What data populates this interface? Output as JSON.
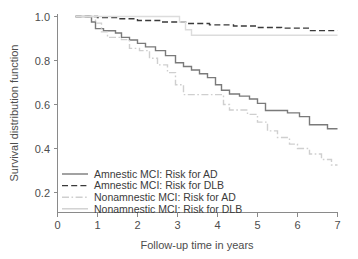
{
  "chart_data": {
    "type": "line",
    "title": "",
    "xlabel": "Follow-up time in years",
    "ylabel": "Survival distribution function",
    "xlim": [
      0,
      7
    ],
    "ylim": [
      0.13,
      1.02
    ],
    "xticks": [
      0,
      1,
      2,
      3,
      4,
      5,
      6,
      7
    ],
    "xtick_labels": [
      "0",
      "1",
      "2",
      "3",
      "4",
      "5",
      "6",
      "7"
    ],
    "yticks": [
      0.2,
      0.4,
      0.6,
      0.8,
      1.0
    ],
    "ytick_labels": [
      "0.2",
      "0.4",
      "0.6",
      "0.8",
      "1.0"
    ],
    "grid": false,
    "legend_position": "lower-left",
    "series": [
      {
        "name": "Amnestic MCI: Risk for AD",
        "style": "solid",
        "color": "#7a7a7a",
        "width": 1.4,
        "points": [
          [
            0.45,
            1.0
          ],
          [
            0.85,
            1.0
          ],
          [
            0.85,
            0.975
          ],
          [
            0.95,
            0.975
          ],
          [
            0.95,
            0.945
          ],
          [
            1.15,
            0.945
          ],
          [
            1.15,
            0.935
          ],
          [
            1.45,
            0.935
          ],
          [
            1.45,
            0.925
          ],
          [
            1.6,
            0.925
          ],
          [
            1.6,
            0.905
          ],
          [
            1.8,
            0.905
          ],
          [
            1.8,
            0.893
          ],
          [
            2.0,
            0.893
          ],
          [
            2.0,
            0.878
          ],
          [
            2.2,
            0.878
          ],
          [
            2.2,
            0.862
          ],
          [
            2.45,
            0.862
          ],
          [
            2.45,
            0.845
          ],
          [
            2.7,
            0.845
          ],
          [
            2.7,
            0.822
          ],
          [
            2.95,
            0.822
          ],
          [
            2.95,
            0.79
          ],
          [
            3.15,
            0.79
          ],
          [
            3.15,
            0.773
          ],
          [
            3.35,
            0.773
          ],
          [
            3.35,
            0.757
          ],
          [
            3.55,
            0.757
          ],
          [
            3.55,
            0.74
          ],
          [
            3.75,
            0.74
          ],
          [
            3.75,
            0.722
          ],
          [
            3.95,
            0.722
          ],
          [
            3.95,
            0.69
          ],
          [
            4.1,
            0.69
          ],
          [
            4.1,
            0.665
          ],
          [
            4.3,
            0.665
          ],
          [
            4.3,
            0.648
          ],
          [
            4.55,
            0.648
          ],
          [
            4.55,
            0.638
          ],
          [
            4.8,
            0.638
          ],
          [
            4.8,
            0.625
          ],
          [
            5.0,
            0.625
          ],
          [
            5.0,
            0.605
          ],
          [
            5.2,
            0.605
          ],
          [
            5.2,
            0.573
          ],
          [
            5.75,
            0.573
          ],
          [
            5.75,
            0.562
          ],
          [
            6.05,
            0.562
          ],
          [
            6.05,
            0.545
          ],
          [
            6.3,
            0.545
          ],
          [
            6.3,
            0.508
          ],
          [
            6.75,
            0.508
          ],
          [
            6.75,
            0.49
          ],
          [
            7.0,
            0.49
          ]
        ]
      },
      {
        "name": "Amnestic MCI: Risk for DLB",
        "style": "dashed",
        "color": "#3a3a3a",
        "width": 1.4,
        "points": [
          [
            0.45,
            1.0
          ],
          [
            1.0,
            1.0
          ],
          [
            1.0,
            0.995
          ],
          [
            1.5,
            0.995
          ],
          [
            1.5,
            0.99
          ],
          [
            2.0,
            0.99
          ],
          [
            2.0,
            0.982
          ],
          [
            2.6,
            0.982
          ],
          [
            2.6,
            0.975
          ],
          [
            3.2,
            0.975
          ],
          [
            3.2,
            0.968
          ],
          [
            3.8,
            0.968
          ],
          [
            3.8,
            0.962
          ],
          [
            4.4,
            0.962
          ],
          [
            4.4,
            0.957
          ],
          [
            5.0,
            0.957
          ],
          [
            5.0,
            0.95
          ],
          [
            5.6,
            0.95
          ],
          [
            5.6,
            0.947
          ],
          [
            6.3,
            0.947
          ],
          [
            6.3,
            0.936
          ],
          [
            7.0,
            0.936
          ]
        ]
      },
      {
        "name": "Nonamnestic MCI: Risk for AD",
        "style": "dashdot",
        "color": "#cfcfcf",
        "width": 1.4,
        "points": [
          [
            0.45,
            1.0
          ],
          [
            0.95,
            1.0
          ],
          [
            0.95,
            0.97
          ],
          [
            1.1,
            0.97
          ],
          [
            1.1,
            0.93
          ],
          [
            1.25,
            0.93
          ],
          [
            1.25,
            0.905
          ],
          [
            1.6,
            0.905
          ],
          [
            1.6,
            0.895
          ],
          [
            1.8,
            0.895
          ],
          [
            1.8,
            0.855
          ],
          [
            2.05,
            0.855
          ],
          [
            2.05,
            0.845
          ],
          [
            2.3,
            0.845
          ],
          [
            2.3,
            0.81
          ],
          [
            2.5,
            0.81
          ],
          [
            2.5,
            0.78
          ],
          [
            2.75,
            0.78
          ],
          [
            2.75,
            0.745
          ],
          [
            2.95,
            0.745
          ],
          [
            2.95,
            0.69
          ],
          [
            3.15,
            0.69
          ],
          [
            3.15,
            0.645
          ],
          [
            4.15,
            0.645
          ],
          [
            4.15,
            0.6
          ],
          [
            4.3,
            0.6
          ],
          [
            4.3,
            0.575
          ],
          [
            4.75,
            0.575
          ],
          [
            4.75,
            0.555
          ],
          [
            5.0,
            0.555
          ],
          [
            5.0,
            0.52
          ],
          [
            5.25,
            0.52
          ],
          [
            5.25,
            0.48
          ],
          [
            5.5,
            0.48
          ],
          [
            5.5,
            0.45
          ],
          [
            5.8,
            0.45
          ],
          [
            5.8,
            0.42
          ],
          [
            6.0,
            0.42
          ],
          [
            6.0,
            0.4
          ],
          [
            6.3,
            0.4
          ],
          [
            6.3,
            0.375
          ],
          [
            6.6,
            0.375
          ],
          [
            6.6,
            0.35
          ],
          [
            6.85,
            0.35
          ],
          [
            6.85,
            0.325
          ],
          [
            7.0,
            0.325
          ]
        ]
      },
      {
        "name": "Nonamnestic MCI: Risk for DLB",
        "style": "solid",
        "color": "#dcdcdc",
        "width": 1.4,
        "points": [
          [
            0.45,
            1.0
          ],
          [
            3.05,
            1.0
          ],
          [
            3.05,
            0.975
          ],
          [
            3.2,
            0.975
          ],
          [
            3.2,
            0.94
          ],
          [
            3.35,
            0.94
          ],
          [
            3.35,
            0.915
          ],
          [
            7.0,
            0.915
          ]
        ]
      }
    ],
    "legend": [
      {
        "label": "Amnestic MCI: Risk for AD",
        "style": "solid",
        "color": "#7a7a7a"
      },
      {
        "label": "Amnestic MCI: Risk for DLB",
        "style": "dashed",
        "color": "#3a3a3a"
      },
      {
        "label": "Nonamnestic MCI: Risk for AD",
        "style": "dashdot",
        "color": "#cfcfcf"
      },
      {
        "label": "Nonamnestic MCI: Risk for DLB",
        "style": "solid",
        "color": "#cfcfcf"
      }
    ]
  }
}
